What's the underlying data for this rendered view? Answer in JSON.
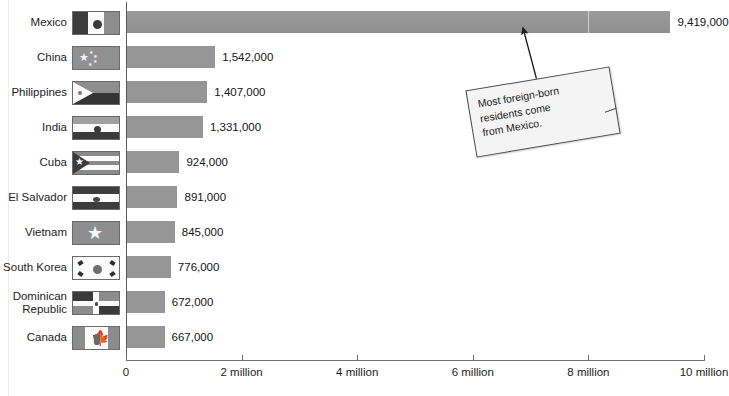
{
  "chart_data": {
    "type": "bar",
    "orientation": "horizontal",
    "title": "",
    "xlabel": "",
    "ylabel": "",
    "xlim": [
      0,
      10000000
    ],
    "grid": false,
    "categories": [
      "Mexico",
      "China",
      "Philippines",
      "India",
      "Cuba",
      "El Salvador",
      "Vietnam",
      "South Korea",
      "Dominican\nRepublic",
      "Canada"
    ],
    "values": [
      9419000,
      1542000,
      1407000,
      1331000,
      924000,
      891000,
      845000,
      776000,
      672000,
      667000
    ],
    "value_labels": [
      "9,419,000",
      "1,542,000",
      "1,407,000",
      "1,331,000",
      "924,000",
      "891,000",
      "845,000",
      "776,000",
      "672,000",
      "667,000"
    ],
    "tick_values": [
      0,
      2000000,
      4000000,
      6000000,
      8000000,
      10000000
    ],
    "tick_labels": [
      "0",
      "2 million",
      "4 million",
      "6 million",
      "8 million",
      "10 million"
    ],
    "bar_color": "#969696",
    "axis_color": "#6e6e6e",
    "annotations": [
      {
        "name": "mexico-callout",
        "text": "Most foreign-born\nresidents come\nfrom Mexico.",
        "points_to": "Mexico"
      }
    ],
    "flags": [
      {
        "country": "Mexico",
        "icon": "flag-mexico"
      },
      {
        "country": "China",
        "icon": "flag-china"
      },
      {
        "country": "Philippines",
        "icon": "flag-philippines"
      },
      {
        "country": "India",
        "icon": "flag-india"
      },
      {
        "country": "Cuba",
        "icon": "flag-cuba"
      },
      {
        "country": "El Salvador",
        "icon": "flag-el-salvador"
      },
      {
        "country": "Vietnam",
        "icon": "flag-vietnam"
      },
      {
        "country": "South Korea",
        "icon": "flag-south-korea"
      },
      {
        "country": "Dominican Republic",
        "icon": "flag-dominican-republic"
      },
      {
        "country": "Canada",
        "icon": "flag-canada"
      }
    ]
  }
}
